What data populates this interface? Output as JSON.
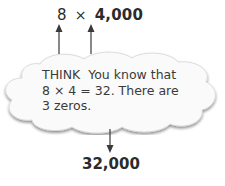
{
  "expression": {
    "factor1": "8",
    "operator": "×",
    "factor2": "4,000"
  },
  "think_bubble": {
    "line1": "THINK  You know that",
    "line2": "8 × 4 = 32. There are",
    "line3": "3 zeros."
  },
  "result": "32,000",
  "colors": {
    "text": "#2b2b2b",
    "cloud_fill": "#fafafa",
    "cloud_shadow": "#cfcfcf",
    "arrow": "#3a3a3a"
  }
}
